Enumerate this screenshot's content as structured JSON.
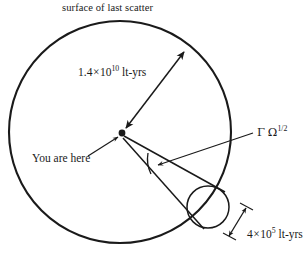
{
  "figure": {
    "title": "surface of last scatter",
    "background_color": "#ffffff",
    "ink_color": "#1a1a1a",
    "labels": {
      "radius": {
        "mantissa": "1.4",
        "times": "×",
        "base": "10",
        "exponent": "10",
        "unit": "lt-yrs",
        "full": "1.4 × 10^10 lt-yrs"
      },
      "observer": "You are here",
      "angle": {
        "gamma": "Γ",
        "omega": "Ω",
        "exponent": "1/2",
        "full": "Γ Ω^1/2"
      },
      "small_scale": {
        "mantissa": "4",
        "times": "×",
        "base": "10",
        "exponent": "5",
        "unit": "lt-yrs",
        "full": "4 × 10^5 lt-yrs"
      }
    },
    "geometry": {
      "main_circle": {
        "cx": 120,
        "cy": 132,
        "r": 111,
        "name": "surface-of-last-scatter-circle"
      },
      "small_circle": {
        "cx": 208,
        "cy": 207,
        "r": 21,
        "name": "causal-horizon-circle"
      },
      "observer_point": {
        "x": 122,
        "y": 133
      },
      "radius_arrow_tip": {
        "x": 186,
        "y": 50
      }
    }
  }
}
